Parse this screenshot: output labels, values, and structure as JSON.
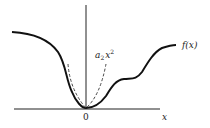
{
  "diagram": {
    "axes": {
      "x_label": "x",
      "origin_label": "0"
    },
    "curves": {
      "function_label": "f(x)",
      "approximation_label_base": "a",
      "approximation_label_sub": "2",
      "approximation_label_var": "x",
      "approximation_label_sup": "2"
    },
    "colors": {
      "stroke": "#111111",
      "background": "#ffffff"
    }
  }
}
